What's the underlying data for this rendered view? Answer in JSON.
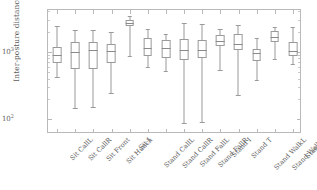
{
  "chart_data": {
    "type": "box",
    "title": "",
    "xlabel": "",
    "ylabel": "Inter-posture distances [Ω]",
    "yscale": "log",
    "ylim": [
      60,
      4200
    ],
    "ytick_labels": [
      "10³",
      "10²"
    ],
    "ytick_values": [
      1000,
      100
    ],
    "ytick_mantissa": [
      "10",
      "10"
    ],
    "ytick_exponent": [
      "3",
      "2"
    ],
    "grid": false,
    "legend": "none",
    "categories": [
      "Sit CallL",
      "Sit CallR",
      "Sit Front",
      "Sit Hunch",
      "Sit I",
      "Stand CallL",
      "Stand CallR",
      "Stand FallL",
      "Stand FallR",
      "Stand I",
      "Stand T",
      "Stand WalkL",
      "Stand WalkR",
      "Stand X"
    ],
    "boxes": [
      {
        "category": "Sit CallL",
        "whisker_low": 420,
        "q1": 690,
        "median": 900,
        "q3": 1180,
        "whisker_high": 2450
      },
      {
        "category": "Sit CallR",
        "whisker_low": 148,
        "q1": 560,
        "median": 1010,
        "q3": 1420,
        "whisker_high": 2150
      },
      {
        "category": "Sit Front",
        "whisker_low": 150,
        "q1": 565,
        "median": 1060,
        "q3": 1400,
        "whisker_high": 2100
      },
      {
        "category": "Sit Hunch",
        "whisker_low": 243,
        "q1": 690,
        "median": 1030,
        "q3": 1310,
        "whisker_high": 1980
      },
      {
        "category": "Sit I",
        "whisker_low": 880,
        "q1": 2450,
        "median": 2700,
        "q3": 3000,
        "whisker_high": 3450
      },
      {
        "category": "Stand CallL",
        "whisker_low": 600,
        "q1": 880,
        "median": 1150,
        "q3": 1620,
        "whisker_high": 2200
      },
      {
        "category": "Stand CallR",
        "whisker_low": 520,
        "q1": 810,
        "median": 1130,
        "q3": 1500,
        "whisker_high": 1830
      },
      {
        "category": "Stand FallL",
        "whisker_low": 88,
        "q1": 760,
        "median": 1080,
        "q3": 1540,
        "whisker_high": 2650
      },
      {
        "category": "Stand FallR",
        "whisker_low": 90,
        "q1": 820,
        "median": 1060,
        "q3": 1500,
        "whisker_high": 2620
      },
      {
        "category": "Stand I",
        "whisker_low": 540,
        "q1": 1220,
        "median": 1460,
        "q3": 1780,
        "whisker_high": 2200
      },
      {
        "category": "Stand T",
        "whisker_low": 228,
        "q1": 1080,
        "median": 1330,
        "q3": 1860,
        "whisker_high": 2520
      },
      {
        "category": "Stand WalkL",
        "whisker_low": 380,
        "q1": 720,
        "median": 950,
        "q3": 1120,
        "whisker_high": 1620
      },
      {
        "category": "Stand WalkR",
        "whisker_low": 790,
        "q1": 1420,
        "median": 1680,
        "q3": 2050,
        "whisker_high": 2380
      },
      {
        "category": "Stand X",
        "whisker_low": 670,
        "q1": 860,
        "median": 1030,
        "q3": 1390,
        "whisker_high": 2320
      }
    ]
  },
  "figure": {
    "frame_color": "#b9b9b9",
    "line_color": "#9a9a9a",
    "text_color": "#5d5d5d",
    "background": "#ffffff"
  }
}
